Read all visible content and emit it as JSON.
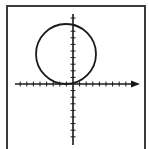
{
  "diagram": {
    "type": "coordinate-plane",
    "colors": {
      "stroke": "#1a1a1a",
      "frame": "#3a3a3a",
      "background": "#ffffff"
    },
    "axes": {
      "x_axis": {
        "y_px": 84,
        "x_start_px": 15,
        "x_end_px": 140,
        "arrow": "right"
      },
      "y_axis": {
        "x_px": 73,
        "y_start_px": 14,
        "y_end_px": 145,
        "arrow": "none"
      },
      "tick_spacing_px": 6.6,
      "tick_half_len_px": 2.5
    },
    "circle": {
      "cx_px": 66,
      "cy_px": 54,
      "r_px": 30,
      "tangent_to": "x-axis"
    }
  }
}
